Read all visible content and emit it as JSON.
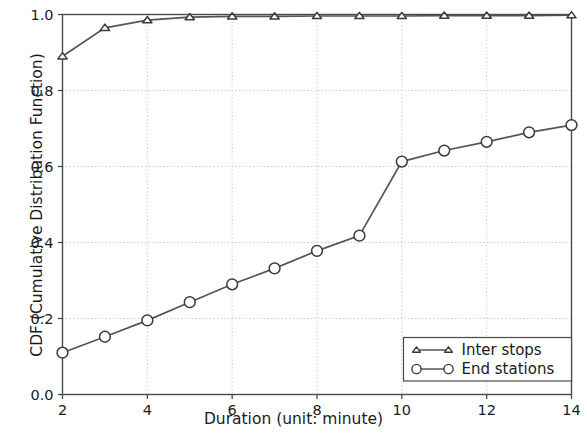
{
  "chart_data": {
    "type": "line",
    "title": "",
    "subtitle": "",
    "xlabel": "Duration (unit: minute)",
    "ylabel": "CDF (Cumulative Distribution Function)",
    "x": [
      2,
      3,
      4,
      5,
      6,
      7,
      8,
      9,
      10,
      11,
      12,
      13,
      14
    ],
    "xlim": [
      2,
      14
    ],
    "ylim": [
      0.0,
      1.0
    ],
    "xticks": [
      2,
      4,
      6,
      8,
      10,
      12,
      14
    ],
    "xtick_labels": [
      "2",
      "4",
      "6",
      "8",
      "10",
      "12",
      "14"
    ],
    "yticks": [
      0.0,
      0.2,
      0.4,
      0.6,
      0.8,
      1.0
    ],
    "ytick_labels": [
      "0.0",
      "0.2",
      "0.4",
      "0.6",
      "0.8",
      "1.0"
    ],
    "grid": true,
    "grid_style": "dotted",
    "legend_position": "lower right",
    "line_color": "#555555",
    "marker_face_color": "#ffffff",
    "series": [
      {
        "name": "Inter stops",
        "marker": "triangle",
        "values": [
          0.89,
          0.965,
          0.985,
          0.993,
          0.995,
          0.995,
          0.996,
          0.996,
          0.996,
          0.997,
          0.997,
          0.997,
          0.998
        ]
      },
      {
        "name": "End stations",
        "marker": "circle",
        "values": [
          0.11,
          0.152,
          0.195,
          0.243,
          0.29,
          0.332,
          0.378,
          0.418,
          0.613,
          0.642,
          0.665,
          0.69,
          0.709
        ]
      }
    ]
  },
  "legend": {
    "entries": [
      {
        "label": "Inter stops",
        "marker": "triangle-marker"
      },
      {
        "label": "End stations",
        "marker": "circle-marker"
      }
    ]
  }
}
